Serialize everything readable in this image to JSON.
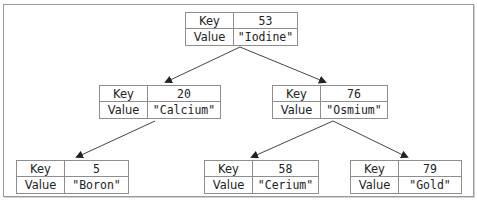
{
  "diagram": {
    "type": "binary-search-tree",
    "key_label": "Key",
    "value_label": "Value",
    "line_color": "#444444",
    "border_color": "#8e8e8e",
    "nodes": [
      {
        "id": "n53",
        "key": "53",
        "value": "\"Iodine\""
      },
      {
        "id": "n20",
        "key": "20",
        "value": "\"Calcium\""
      },
      {
        "id": "n76",
        "key": "76",
        "value": "\"Osmium\""
      },
      {
        "id": "n5",
        "key": "5",
        "value": "\"Boron\""
      },
      {
        "id": "n58",
        "key": "58",
        "value": "\"Cerium\""
      },
      {
        "id": "n79",
        "key": "79",
        "value": "\"Gold\""
      }
    ],
    "edges": [
      {
        "from": "53",
        "to": "20"
      },
      {
        "from": "53",
        "to": "76"
      },
      {
        "from": "20",
        "to": "5"
      },
      {
        "from": "76",
        "to": "58"
      },
      {
        "from": "76",
        "to": "79"
      }
    ]
  }
}
